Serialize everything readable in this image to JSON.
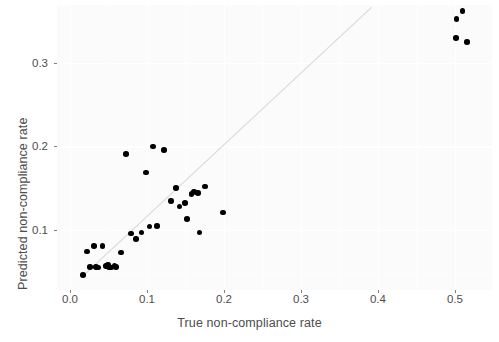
{
  "chart_data": {
    "type": "scatter",
    "title": "",
    "xlabel": "True non-compliance rate",
    "ylabel": "Predicted non-compliance rate",
    "xlim": [
      -0.0169,
      0.5481
    ],
    "ylim": [
      0.0281,
      0.3695
    ],
    "xticks": [
      0.0,
      0.1,
      0.2,
      0.3,
      0.4,
      0.5
    ],
    "xtick_labels": [
      "0.0",
      "0.1",
      "0.2",
      "0.3",
      "0.4",
      "0.5"
    ],
    "yticks": [
      0.1,
      0.2,
      0.3
    ],
    "ytick_labels": [
      "0.1",
      "0.2",
      "0.3"
    ],
    "grid": true,
    "legend": "none",
    "annotations": [
      {
        "type": "line",
        "role": "identity-reference-line",
        "description": "y = x diagonal reference line",
        "color": "#d9d9d9",
        "from": [
          0.018,
          0.046
        ],
        "to": [
          0.392,
          0.367
        ]
      }
    ],
    "marker": {
      "shape": "circle",
      "color": "#000000",
      "size": 5.6
    },
    "points": [
      {
        "x": 0.017,
        "y": 0.046
      },
      {
        "x": 0.022,
        "y": 0.074
      },
      {
        "x": 0.026,
        "y": 0.056
      },
      {
        "x": 0.031,
        "y": 0.081
      },
      {
        "x": 0.034,
        "y": 0.056
      },
      {
        "x": 0.036,
        "y": 0.055
      },
      {
        "x": 0.042,
        "y": 0.081
      },
      {
        "x": 0.047,
        "y": 0.057
      },
      {
        "x": 0.049,
        "y": 0.058
      },
      {
        "x": 0.051,
        "y": 0.056
      },
      {
        "x": 0.053,
        "y": 0.055
      },
      {
        "x": 0.058,
        "y": 0.057
      },
      {
        "x": 0.06,
        "y": 0.056
      },
      {
        "x": 0.066,
        "y": 0.073
      },
      {
        "x": 0.073,
        "y": 0.191
      },
      {
        "x": 0.079,
        "y": 0.096
      },
      {
        "x": 0.086,
        "y": 0.089
      },
      {
        "x": 0.093,
        "y": 0.097
      },
      {
        "x": 0.099,
        "y": 0.169
      },
      {
        "x": 0.103,
        "y": 0.104
      },
      {
        "x": 0.108,
        "y": 0.2
      },
      {
        "x": 0.113,
        "y": 0.105
      },
      {
        "x": 0.122,
        "y": 0.196
      },
      {
        "x": 0.131,
        "y": 0.135
      },
      {
        "x": 0.138,
        "y": 0.15
      },
      {
        "x": 0.142,
        "y": 0.128
      },
      {
        "x": 0.149,
        "y": 0.132
      },
      {
        "x": 0.152,
        "y": 0.113
      },
      {
        "x": 0.158,
        "y": 0.143
      },
      {
        "x": 0.161,
        "y": 0.146
      },
      {
        "x": 0.163,
        "y": 0.145
      },
      {
        "x": 0.166,
        "y": 0.144
      },
      {
        "x": 0.168,
        "y": 0.097
      },
      {
        "x": 0.175,
        "y": 0.152
      },
      {
        "x": 0.199,
        "y": 0.121
      },
      {
        "x": 0.501,
        "y": 0.33
      },
      {
        "x": 0.502,
        "y": 0.353
      },
      {
        "x": 0.51,
        "y": 0.362
      },
      {
        "x": 0.516,
        "y": 0.325
      }
    ]
  }
}
